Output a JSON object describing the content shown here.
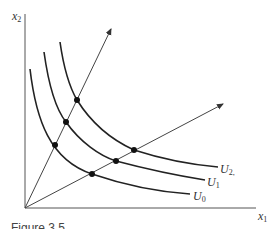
{
  "diagram": {
    "axes": {
      "x_label": "x",
      "x_sub": "1",
      "y_label": "x",
      "y_sub": "2"
    },
    "curves": [
      {
        "name": "U",
        "sub": "0"
      },
      {
        "name": "U",
        "sub": "1"
      },
      {
        "name": "U",
        "sub": "2,"
      }
    ],
    "rays": [
      "steep-ray",
      "shallow-ray"
    ],
    "caption": "Figure 3.5"
  }
}
